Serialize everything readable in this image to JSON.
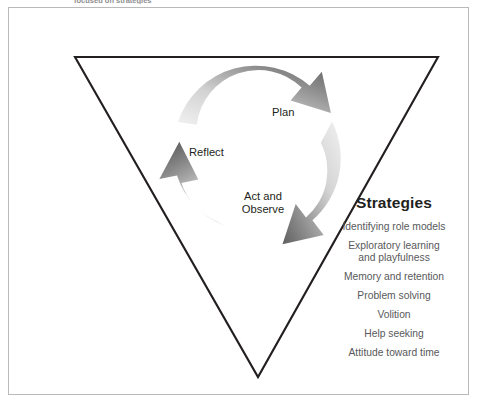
{
  "caption": {
    "text": "focused on strategies"
  },
  "diagram": {
    "shape": "inverted-triangle",
    "colors": {
      "triangle_outline": "#231f20",
      "frame_border": "#b9b9b9",
      "arrow_dark": "#6a6a6a",
      "arrow_light": "#ededed",
      "label_text": "#231f20",
      "list_text": "#58595b",
      "background": "#ffffff"
    },
    "cycle": {
      "direction": "clockwise",
      "stages": [
        {
          "id": "plan",
          "label": "Plan"
        },
        {
          "id": "act-and-observe",
          "label": "Act and\nObserve"
        },
        {
          "id": "reflect",
          "label": "Reflect"
        }
      ]
    }
  },
  "strategies": {
    "title": "Strategies",
    "items": [
      "Identifying role models",
      "Exploratory learning\nand playfulness",
      "Memory and retention",
      "Problem solving",
      "Volition",
      "Help seeking",
      "Attitude toward time"
    ]
  }
}
